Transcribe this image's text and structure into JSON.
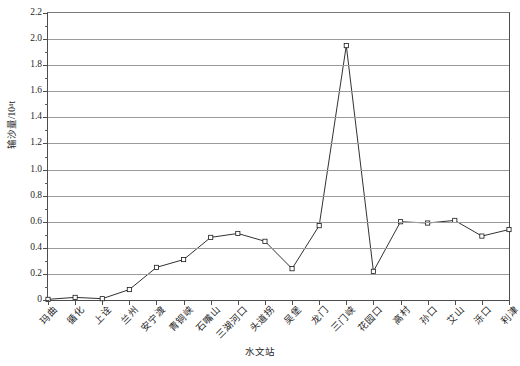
{
  "chart_data": {
    "type": "line",
    "title": "",
    "subtitle": "",
    "xlabel": "水文站",
    "ylabel": "输沙量/10⁴t",
    "ylim": [
      0,
      2.2
    ],
    "ytick_step": 0.2,
    "yticks": [
      "0",
      "0.2",
      "0.4",
      "0.6",
      "0.8",
      "1.0",
      "1.2",
      "1.4",
      "1.6",
      "1.8",
      "2.0",
      "2.2"
    ],
    "grid": true,
    "grid_axis": "y",
    "legend": false,
    "legend_position": "none",
    "marker": "open-square",
    "line_color": "#1a1a1a",
    "marker_fill": "#ffffff",
    "categories": [
      "玛曲",
      "循化",
      "上诠",
      "兰州",
      "安宁渡",
      "青铜峡",
      "石嘴山",
      "三湖河口",
      "头道拐",
      "吴堡",
      "龙门",
      "三门峡",
      "花园口",
      "高村",
      "孙口",
      "艾山",
      "泺口",
      "利津"
    ],
    "values": [
      0.005,
      0.02,
      0.01,
      0.08,
      0.25,
      0.31,
      0.48,
      0.51,
      0.45,
      0.24,
      0.57,
      1.95,
      0.22,
      0.6,
      0.59,
      0.61,
      0.49,
      0.54
    ],
    "series": [
      {
        "name": "输沙量",
        "values": [
          0.005,
          0.02,
          0.01,
          0.08,
          0.25,
          0.31,
          0.48,
          0.51,
          0.45,
          0.24,
          0.57,
          1.95,
          0.22,
          0.6,
          0.59,
          0.61,
          0.49,
          0.54
        ]
      }
    ],
    "annotations": []
  }
}
